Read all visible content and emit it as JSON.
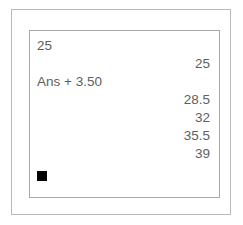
{
  "device": {
    "type": "graphing-calculator",
    "screen_label": "home-screen"
  },
  "colors": {
    "text": "#5e5e5e",
    "cursor": "#000000",
    "background": "#ffffff",
    "outer_border": "#b9b9b9",
    "screen_border": "#a8a8a8"
  },
  "screen": {
    "lines": [
      {
        "kind": "entry",
        "text": "25"
      },
      {
        "kind": "result",
        "text": "25"
      },
      {
        "kind": "entry",
        "text": "Ans + 3.50"
      },
      {
        "kind": "result",
        "text": "28.5"
      },
      {
        "kind": "result",
        "text": "32"
      },
      {
        "kind": "result",
        "text": "35.5"
      },
      {
        "kind": "result",
        "text": "39"
      }
    ],
    "cursor": {
      "glyph": "cursor-block",
      "visible": true
    }
  }
}
